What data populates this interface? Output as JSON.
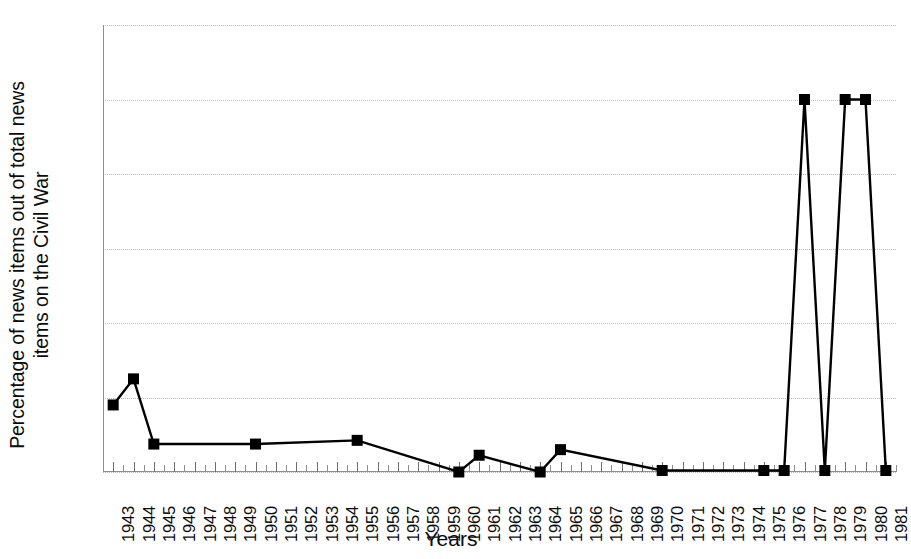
{
  "chart_data": {
    "type": "line",
    "title": "",
    "xlabel": "Years",
    "ylabel": "Percentage of news items out of total news items on the Civil War",
    "ylabel_lines": [
      "Percentage of news items out of total news",
      "items on the Civil War"
    ],
    "ylim": [
      0,
      120
    ],
    "yticks": [
      0,
      20,
      40,
      60,
      80,
      100,
      120
    ],
    "grid": true,
    "legend": "none",
    "marker": "square",
    "line_color": "#000000",
    "marker_color": "#000000",
    "grid_color": "#b9b9b9",
    "axis_color": "#8e8e8e",
    "categories": [
      "1943",
      "1944",
      "1945",
      "1946",
      "1947",
      "1948",
      "1949",
      "1950",
      "1951",
      "1952",
      "1953",
      "1954",
      "1955",
      "1956",
      "1957",
      "1958",
      "1959",
      "1960",
      "1961",
      "1962",
      "1963",
      "1964",
      "1965",
      "1966",
      "1967",
      "1968",
      "1969",
      "1970",
      "1971",
      "1972",
      "1973",
      "1974",
      "1975",
      "1976",
      "1977",
      "1978",
      "1979",
      "1980",
      "1981"
    ],
    "values": [
      18,
      25,
      7.5,
      null,
      null,
      null,
      null,
      7.5,
      null,
      null,
      null,
      null,
      8.5,
      null,
      null,
      null,
      null,
      0,
      4.5,
      null,
      null,
      0,
      6,
      null,
      null,
      null,
      null,
      0.4,
      null,
      null,
      null,
      null,
      0.4,
      0.4,
      100,
      0.4,
      100,
      100,
      0.4
    ],
    "marked_points": [
      {
        "year": "1943",
        "value": 18
      },
      {
        "year": "1944",
        "value": 25
      },
      {
        "year": "1945",
        "value": 7.5
      },
      {
        "year": "1950",
        "value": 7.5
      },
      {
        "year": "1955",
        "value": 8.5
      },
      {
        "year": "1960",
        "value": 0
      },
      {
        "year": "1961",
        "value": 4.5
      },
      {
        "year": "1964",
        "value": 0
      },
      {
        "year": "1965",
        "value": 6
      },
      {
        "year": "1970",
        "value": 0.4
      },
      {
        "year": "1975",
        "value": 0.4
      },
      {
        "year": "1976",
        "value": 0.4
      },
      {
        "year": "1977",
        "value": 100
      },
      {
        "year": "1978",
        "value": 0.4
      },
      {
        "year": "1979",
        "value": 100
      },
      {
        "year": "1980",
        "value": 100
      },
      {
        "year": "1981",
        "value": 0.4
      }
    ]
  }
}
